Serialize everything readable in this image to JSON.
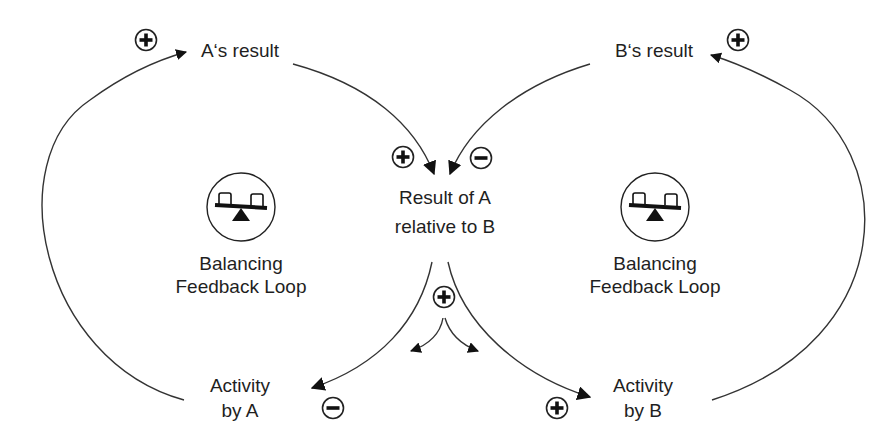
{
  "diagram": {
    "nodes": {
      "a_result": "A‘s result",
      "b_result": "B‘s result",
      "relative_line1": "Result of A",
      "relative_line2": "relative to B",
      "activity_a_line1": "Activity",
      "activity_a_line2": "by A",
      "activity_b_line1": "Activity",
      "activity_b_line2": "by B"
    },
    "loops": {
      "left": {
        "line1": "Balancing",
        "line2": "Feedback Loop",
        "icon": "seesaw-icon"
      },
      "right": {
        "line1": "Balancing",
        "line2": "Feedback Loop",
        "icon": "seesaw-icon"
      }
    },
    "links": [
      {
        "from": "Activity by A",
        "to": "A‘s result",
        "polarity": "+"
      },
      {
        "from": "Activity by B",
        "to": "B‘s result",
        "polarity": "+"
      },
      {
        "from": "A‘s result",
        "to": "Result of A relative to B",
        "polarity": "+"
      },
      {
        "from": "B‘s result",
        "to": "Result of A relative to B",
        "polarity": "-"
      },
      {
        "from": "Result of A relative to B",
        "to": "Activity by A",
        "polarity": "-"
      },
      {
        "from": "Result of A relative to B",
        "to": "Activity by B",
        "polarity": "+"
      },
      {
        "from": "Result of A relative to B",
        "to": "split",
        "polarity": "+"
      }
    ],
    "colors": {
      "line": "#333333",
      "text": "#1f1f1f",
      "background": "#ffffff"
    }
  }
}
